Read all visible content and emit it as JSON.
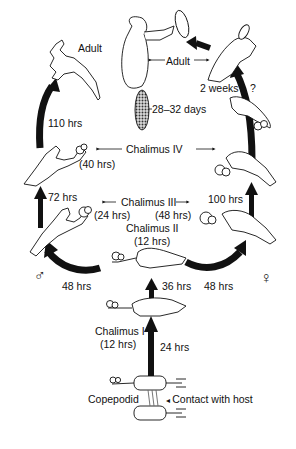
{
  "diagram": {
    "type": "life-cycle",
    "colors": {
      "ink": "#111111",
      "background": "#ffffff",
      "egg_string": "#555555"
    }
  },
  "stages": {
    "copepodid": {
      "label": "Copepodid",
      "note": "Contact with host"
    },
    "chalimus_1": {
      "label": "Chalimus I",
      "duration": "(12 hrs)"
    },
    "chalimus_2": {
      "label": "Chalimus II",
      "duration": "(12 hrs)"
    },
    "chalimus_3": {
      "label": "Chalimus III",
      "male_duration": "(24 hrs)",
      "female_duration": "(48 hrs)"
    },
    "chalimus_4": {
      "label": "Chalimus IV",
      "male_duration": "(40 hrs)"
    },
    "adult_male": {
      "label": "Adult"
    },
    "adult_female": {
      "label": "Adult",
      "egg_duration": "28–32 days"
    }
  },
  "transitions": {
    "copepodid_to_chalimus_1": "24 hrs",
    "chalimus_1_to_2": "36 hrs",
    "chalimus_2_to_3_male": "48 hrs",
    "chalimus_2_to_3_female": "48 hrs",
    "chalimus_3_to_4_male": "72 hrs",
    "chalimus_3_to_4_female": "100 hrs",
    "chalimus_4_to_adult_male": "110 hrs",
    "female_pre_adult": "2 weeks",
    "female_pre_adult_uncertain": "?"
  },
  "symbols": {
    "male": "♂",
    "female": "♀"
  }
}
